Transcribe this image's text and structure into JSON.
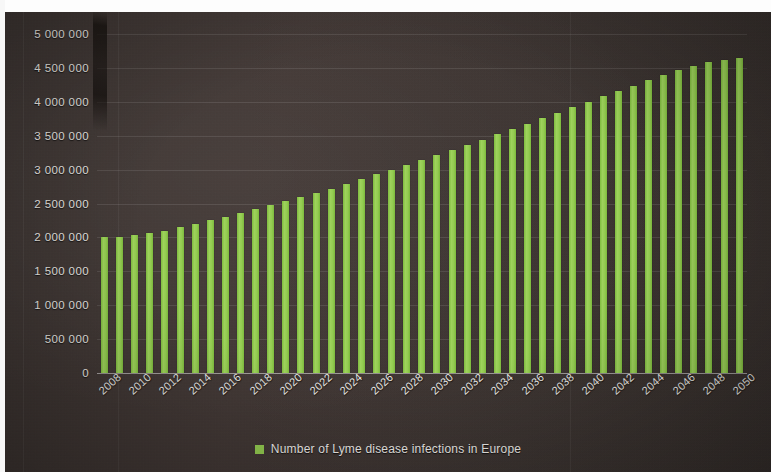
{
  "chart_data": {
    "type": "bar",
    "title": "",
    "subtitle": "",
    "xlabel": "",
    "ylabel": "",
    "grid": true,
    "legend_position": "bottom",
    "legend": [
      "Number of Lyme disease infections in Europe"
    ],
    "series_color": "#93cb50",
    "ylim": [
      0,
      5000000
    ],
    "ytick_values": [
      0,
      500000,
      1000000,
      1500000,
      2000000,
      2500000,
      3000000,
      3500000,
      4000000,
      4500000,
      5000000
    ],
    "ytick_labels": [
      "0",
      "500 000",
      "1 000 000",
      "1 500 000",
      "2 000 000",
      "2 500 000",
      "3 000 000",
      "3 500 000",
      "4 000 000",
      "4 500 000",
      "5 000 000"
    ],
    "xtick_labels": [
      "2008",
      "2010",
      "2012",
      "2014",
      "2016",
      "2018",
      "2020",
      "2022",
      "2024",
      "2026",
      "2028",
      "2030",
      "2032",
      "2034",
      "2036",
      "2038",
      "2040",
      "2042",
      "2044",
      "2046",
      "2048",
      "2050"
    ],
    "categories": [
      "2008",
      "2009",
      "2010",
      "2011",
      "2012",
      "2013",
      "2014",
      "2015",
      "2016",
      "2017",
      "2018",
      "2019",
      "2020",
      "2021",
      "2022",
      "2023",
      "2024",
      "2025",
      "2026",
      "2027",
      "2028",
      "2029",
      "2030",
      "2031",
      "2032",
      "2033",
      "2034",
      "2035",
      "2036",
      "2037",
      "2038",
      "2039",
      "2040",
      "2041",
      "2042",
      "2043",
      "2044",
      "2045",
      "2046",
      "2047",
      "2048",
      "2049",
      "2050"
    ],
    "series": [
      {
        "name": "Number of Lyme disease infections in Europe",
        "values": [
          2000000,
          2010000,
          2030000,
          2060000,
          2100000,
          2150000,
          2200000,
          2250000,
          2300000,
          2360000,
          2420000,
          2480000,
          2540000,
          2600000,
          2660000,
          2720000,
          2790000,
          2860000,
          2930000,
          3000000,
          3070000,
          3140000,
          3210000,
          3290000,
          3360000,
          3440000,
          3520000,
          3600000,
          3680000,
          3760000,
          3840000,
          3920000,
          4000000,
          4080000,
          4160000,
          4240000,
          4320000,
          4400000,
          4470000,
          4530000,
          4580000,
          4620000,
          4650000
        ]
      }
    ]
  },
  "legend": {
    "label": "Number of Lyme disease infections in Europe"
  }
}
